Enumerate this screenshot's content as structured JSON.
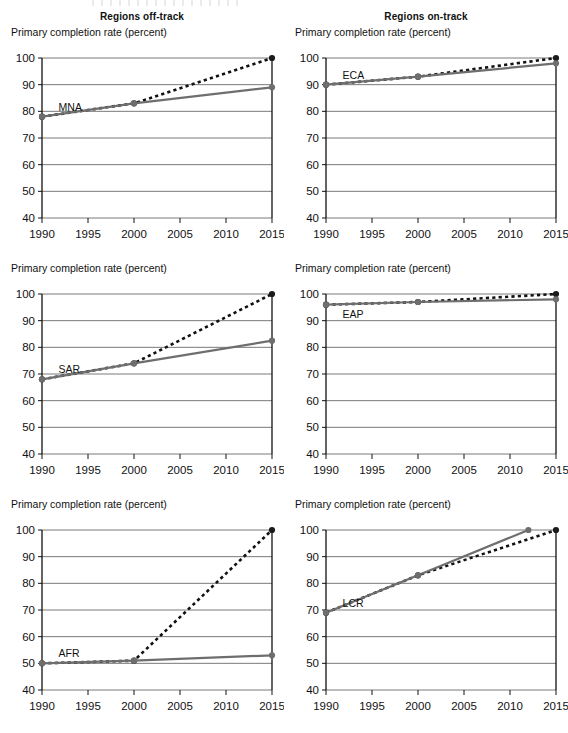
{
  "headers": {
    "left_column_title": "Regions off-track",
    "right_column_title": "Regions on-track"
  },
  "axis_label": "Primary completion rate (percent)",
  "colors": {
    "actual_line": "#6e6e6e",
    "target_line": "#111111",
    "gridline": "#7a7a7a",
    "axis": "#111111",
    "marker": "#1a1a1a",
    "text": "#111111"
  },
  "chart_data": [
    {
      "type": "line",
      "title": "MNA",
      "panel": "top-left",
      "column": "Regions off-track",
      "xlabel": "",
      "ylabel": "Primary completion rate (percent)",
      "xlim": [
        1990,
        2015
      ],
      "ylim": [
        40,
        100
      ],
      "yticks": [
        40,
        50,
        60,
        70,
        80,
        90,
        100
      ],
      "xticks": [
        1990,
        1995,
        2000,
        2005,
        2010,
        2015
      ],
      "grid": true,
      "legend": "inline-label",
      "series": [
        {
          "name": "Actual / projected",
          "style": "solid",
          "color": "#6e6e6e",
          "x": [
            1990,
            2000,
            2015
          ],
          "values": [
            78,
            83,
            89
          ]
        },
        {
          "name": "Target path to 100%",
          "style": "dashed",
          "color": "#111111",
          "x": [
            1990,
            2000,
            2015
          ],
          "values": [
            78,
            83,
            100
          ]
        }
      ]
    },
    {
      "type": "line",
      "title": "ECA",
      "panel": "top-right",
      "column": "Regions on-track",
      "xlabel": "",
      "ylabel": "Primary completion rate (percent)",
      "xlim": [
        1990,
        2015
      ],
      "ylim": [
        40,
        100
      ],
      "yticks": [
        40,
        50,
        60,
        70,
        80,
        90,
        100
      ],
      "xticks": [
        1990,
        1995,
        2000,
        2005,
        2010,
        2015
      ],
      "grid": true,
      "legend": "inline-label",
      "series": [
        {
          "name": "Actual / projected",
          "style": "solid",
          "color": "#6e6e6e",
          "x": [
            1990,
            2000,
            2015
          ],
          "values": [
            90,
            93,
            98
          ]
        },
        {
          "name": "Target path to 100%",
          "style": "dashed",
          "color": "#111111",
          "x": [
            1990,
            2000,
            2015
          ],
          "values": [
            90,
            93,
            100
          ]
        }
      ]
    },
    {
      "type": "line",
      "title": "SAR",
      "panel": "middle-left",
      "column": "Regions off-track",
      "xlabel": "",
      "ylabel": "Primary completion rate (percent)",
      "xlim": [
        1990,
        2015
      ],
      "ylim": [
        40,
        100
      ],
      "yticks": [
        40,
        50,
        60,
        70,
        80,
        90,
        100
      ],
      "xticks": [
        1990,
        1995,
        2000,
        2005,
        2010,
        2015
      ],
      "grid": true,
      "legend": "inline-label",
      "series": [
        {
          "name": "Actual / projected",
          "style": "solid",
          "color": "#6e6e6e",
          "x": [
            1990,
            2000,
            2015
          ],
          "values": [
            68,
            74,
            82.5
          ]
        },
        {
          "name": "Target path to 100%",
          "style": "dashed",
          "color": "#111111",
          "x": [
            1990,
            2000,
            2015
          ],
          "values": [
            68,
            74,
            100
          ]
        }
      ]
    },
    {
      "type": "line",
      "title": "EAP",
      "panel": "middle-right",
      "column": "Regions on-track",
      "xlabel": "",
      "ylabel": "Primary completion rate (percent)",
      "xlim": [
        1990,
        2015
      ],
      "ylim": [
        40,
        100
      ],
      "yticks": [
        40,
        50,
        60,
        70,
        80,
        90,
        100
      ],
      "xticks": [
        1990,
        1995,
        2000,
        2005,
        2010,
        2015
      ],
      "grid": true,
      "legend": "inline-label",
      "series": [
        {
          "name": "Actual / projected",
          "style": "solid",
          "color": "#6e6e6e",
          "x": [
            1990,
            2000,
            2015
          ],
          "values": [
            96,
            97,
            98
          ]
        },
        {
          "name": "Target path to 100%",
          "style": "dashed",
          "color": "#111111",
          "x": [
            1990,
            2000,
            2015
          ],
          "values": [
            96,
            97,
            100
          ]
        }
      ]
    },
    {
      "type": "line",
      "title": "AFR",
      "panel": "bottom-left",
      "column": "Regions off-track",
      "xlabel": "",
      "ylabel": "Primary completion rate (percent)",
      "xlim": [
        1990,
        2015
      ],
      "ylim": [
        40,
        100
      ],
      "yticks": [
        40,
        50,
        60,
        70,
        80,
        90,
        100
      ],
      "xticks": [
        1990,
        1995,
        2000,
        2005,
        2010,
        2015
      ],
      "grid": true,
      "legend": "inline-label",
      "series": [
        {
          "name": "Actual / projected",
          "style": "solid",
          "color": "#6e6e6e",
          "x": [
            1990,
            2000,
            2015
          ],
          "values": [
            50,
            51,
            53
          ]
        },
        {
          "name": "Target path to 100%",
          "style": "dashed",
          "color": "#111111",
          "x": [
            1990,
            2000,
            2015
          ],
          "values": [
            50,
            51,
            100
          ]
        }
      ]
    },
    {
      "type": "line",
      "title": "LCR",
      "panel": "bottom-right",
      "column": "Regions on-track",
      "xlabel": "",
      "ylabel": "Primary completion rate (percent)",
      "xlim": [
        1990,
        2015
      ],
      "ylim": [
        40,
        100
      ],
      "yticks": [
        40,
        50,
        60,
        70,
        80,
        90,
        100
      ],
      "xticks": [
        1990,
        1995,
        2000,
        2005,
        2010,
        2015
      ],
      "grid": true,
      "legend": "inline-label",
      "series": [
        {
          "name": "Actual / projected",
          "style": "solid",
          "color": "#6e6e6e",
          "x": [
            1990,
            2000,
            2012
          ],
          "values": [
            69,
            83,
            100
          ]
        },
        {
          "name": "Target path to 100%",
          "style": "dashed",
          "color": "#111111",
          "x": [
            1990,
            2000,
            2015
          ],
          "values": [
            69,
            83,
            100
          ]
        }
      ]
    }
  ]
}
